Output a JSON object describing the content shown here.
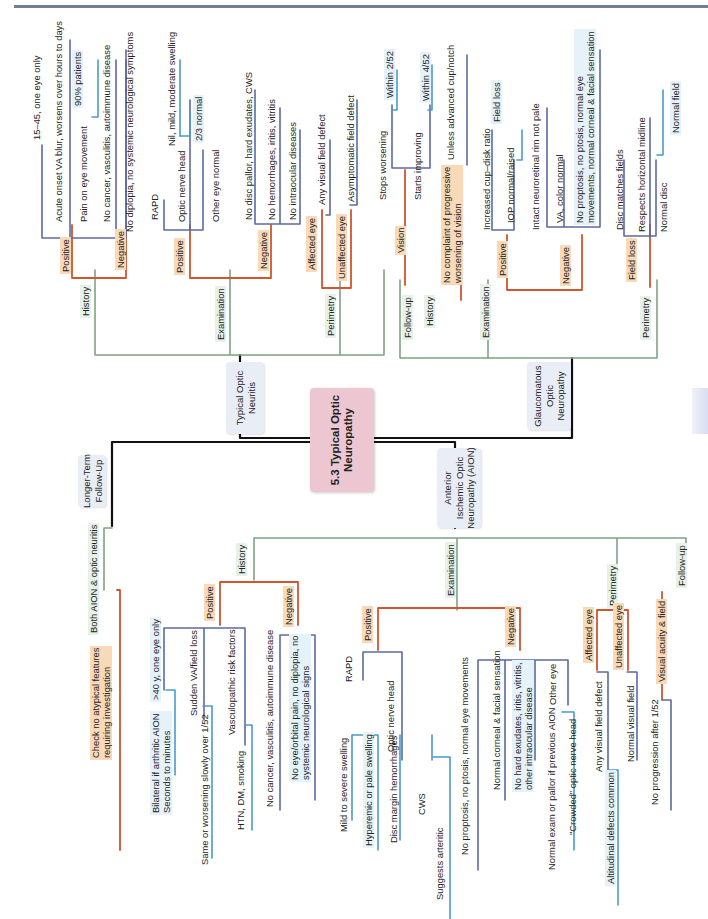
{
  "colors": {
    "main_connector": "#111111",
    "category_connector": "#7fa383",
    "polarity_connector": "#d0562c",
    "item_connector": "#5d6aa0",
    "detail_connector": "#4a9cc7",
    "center_fill": "#ecc7d2",
    "topic_fill": "#e9edf6",
    "orange_tag": "#f8d9b8",
    "green_tag": "#e6f1e8"
  },
  "center": {
    "title": "5.3 Typical Optic\nNeuropathy"
  },
  "topics": {
    "typical_optic_neuritis": "Typical Optic\nNeuritis",
    "glaucomatous": "Glaucomatous\nOptic\nNeuropathy",
    "aion": "Anterior\nIschemic Optic\nNeuropathy (AION)",
    "longer_term": "Longer-Term\nFollow-Up"
  },
  "optic_neuritis": {
    "history": "History",
    "positive": "Positive",
    "negative": "Negative",
    "age": "15–45, one eye only",
    "acute": "Acute onset VA blur, worsens over hours to days",
    "pain": "Pain on eye movement",
    "pain_pct": "90% patients",
    "no_cancer": "No cancer, vasculitis, autoimmune disease",
    "no_diplopia": "No diplopia, no systemic neurological symptoms",
    "examination": "Examination",
    "ex_positive": "Positive",
    "ex_negative": "Negative",
    "rapd": "RAPD",
    "onh": "Optic nerve head",
    "onh_swelling": "Nil, mild, moderate swelling",
    "onh_normal": "2/3 normal",
    "other_eye": "Other eye normal",
    "no_disc_pallor": "No disc pallor, hard exudates, CWS",
    "no_hemorrhages": "No hemorrhages, iritis, vitritis",
    "no_intraocular": "No intraocular diseases",
    "perimetry": "Perimetry",
    "affected_eye": "Affected eye",
    "unaffected_eye": "Unaffected eye",
    "any_vf_defect": "Any visual field defect",
    "asymptomatic": "Asymptomatic field defect",
    "follow_up": "Follow-up",
    "vision": "Vision",
    "stops_worsening": "Stops worsening",
    "within_2_52": "Within 2/52",
    "starts_improving": "Starts improving",
    "within_4_52": "Within 4/52"
  },
  "glaucoma": {
    "history": "History",
    "no_complaint": "No complaint of progressive\nworsening of vision",
    "unless_advanced": "Unless advanced cup/notch",
    "examination": "Examination",
    "positive": "Positive",
    "negative": "Negative",
    "cup_disk": "Increased cup–disk ratio",
    "field_loss_detail": "Field loss",
    "iop": "IOP normal/raised",
    "intact_rim": "Intact neuroretinal rim not pale",
    "va_color": "VA, color normal",
    "no_proptosis": "No proptosis, no ptosis, normal eye\nmovements, normal corneal & facial sensation",
    "perimetry": "Perimetry",
    "field_loss": "Field loss",
    "disc_matches": "Disc matches fields",
    "horizontal_midline": "Respects horizontal midline",
    "normal_disc": "Normal disc",
    "normal_field": "Normal field"
  },
  "longer_term": {
    "both": "Both AION & optic neuritis",
    "check": "Check no atypical features\nrequiring investigation"
  },
  "aion": {
    "history": "History",
    "positive": "Positive",
    "negative": "Negative",
    "over_40": ">40 y, one eye only",
    "bilateral": "Bilateral if arthritic AION\nSeconds to minutes",
    "sudden_va": "Sudden VA/field loss",
    "same_or_worsening": "Same or worsening slowly over 1/52",
    "vasculopathic": "Vasculopathic risk factors",
    "htn": "HTN, DM, smoking",
    "no_cancer": "No cancer, vasculitis, autoimmune disease",
    "no_eye_pain": "No eye/orbital pain, no diplopia, no\nsystemic neurological signs",
    "examination": "Examination",
    "ex_positive": "Positive",
    "ex_negative": "Negative",
    "rapd": "RAPD",
    "onh": "Optic nerve head",
    "mild_severe": "Mild to severe swelling",
    "hyperemic": "Hyperemic or pale swelling",
    "disc_margin": "Disc margin hemorrhages",
    "cws": "CWS",
    "suggests_arteritic": "Suggests arteritic",
    "no_proptosis": "No proptosis, no ptosis, normal eye movements",
    "normal_corneal": "Normal corneal & facial sensation",
    "no_hard_exudates": "No hard exudates, iritis, vitritis,\nother intraocular disease",
    "other_eye": "Other eye",
    "normal_exam": "Normal exam or pallor if previous AION",
    "crowded": "\"Crowded\" optic nerve head",
    "perimetry": "Perimetry",
    "affected_eye": "Affected eye",
    "unaffected_eye": "Unaffected eye",
    "any_vf_defect": "Any visual field defect",
    "altitudinal": "Altitudinal defects common",
    "normal_vf": "Normal visual field",
    "follow_up": "Follow-up",
    "va_field": "Visual acuity & field",
    "no_progression": "No progression after 1/52"
  }
}
